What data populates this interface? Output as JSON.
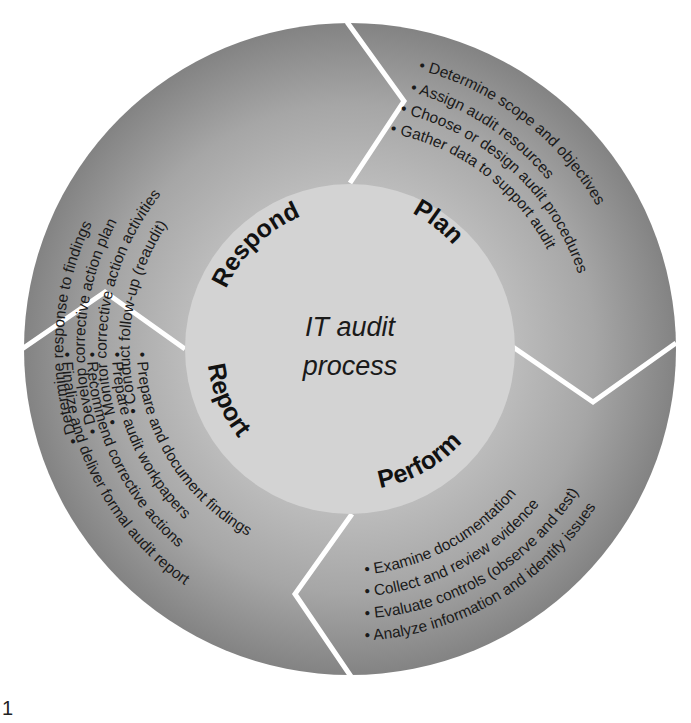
{
  "diagram": {
    "title_line1": "IT audit",
    "title_line2": "process",
    "figure_number": "1",
    "colors": {
      "ring_inner": "#b9b9b9",
      "ring_outer": "#858585",
      "center": "#d2d2d2",
      "separator": "#ffffff",
      "text": "#1a1a1a"
    },
    "phases": [
      {
        "name": "Respond",
        "items": [
          "• Determine response to findings",
          "• Develop corrective action plan",
          "• Monitor corrective action activities",
          "• Conduct follow-up (reaudit)"
        ]
      },
      {
        "name": "Plan",
        "items": [
          "• Determine scope and objectives",
          "• Assign audit resources",
          "• Choose or design audit procedures",
          "• Gather data to support audit"
        ]
      },
      {
        "name": "Perform",
        "items": [
          "• Examine documentation",
          "• Collect and review evidence",
          "• Evaluate controls (observe and test)",
          "• Analyze information and identify issues"
        ]
      },
      {
        "name": "Report",
        "items": [
          "• Prepare and document findings",
          "• Prepare audit workpapers",
          "• Recommend corrective actions",
          "• Finalize and deliver formal audit report"
        ]
      }
    ]
  }
}
